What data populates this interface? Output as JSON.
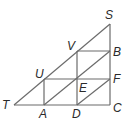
{
  "diagram": {
    "type": "geometry",
    "points": {
      "T": {
        "x": 14,
        "y": 105,
        "label": "T",
        "lx": 2,
        "ly": 109
      },
      "A": {
        "x": 44,
        "y": 105,
        "label": "A",
        "lx": 39,
        "ly": 118
      },
      "D": {
        "x": 77,
        "y": 105,
        "label": "D",
        "lx": 72,
        "ly": 118
      },
      "C": {
        "x": 110,
        "y": 105,
        "label": "C",
        "lx": 113,
        "ly": 112
      },
      "U": {
        "x": 44,
        "y": 79,
        "label": "U",
        "lx": 35,
        "ly": 78
      },
      "E": {
        "x": 77,
        "y": 79,
        "label": "E",
        "lx": 79,
        "ly": 92
      },
      "F": {
        "x": 110,
        "y": 79,
        "label": "F",
        "lx": 113,
        "ly": 83
      },
      "V": {
        "x": 77,
        "y": 51,
        "label": "V",
        "lx": 67,
        "ly": 50
      },
      "B": {
        "x": 110,
        "y": 51,
        "label": "B",
        "lx": 113,
        "ly": 56
      },
      "S": {
        "x": 110,
        "y": 24,
        "label": "S",
        "lx": 105,
        "ly": 19
      }
    },
    "segments": [
      [
        "T",
        "S"
      ],
      [
        "S",
        "C"
      ],
      [
        "T",
        "C"
      ],
      [
        "U",
        "F"
      ],
      [
        "V",
        "B"
      ],
      [
        "A",
        "U"
      ],
      [
        "D",
        "V"
      ],
      [
        "A",
        "B"
      ],
      [
        "D",
        "F"
      ]
    ],
    "labels": [
      "S",
      "V",
      "B",
      "U",
      "F",
      "E",
      "T",
      "A",
      "D",
      "C"
    ]
  }
}
